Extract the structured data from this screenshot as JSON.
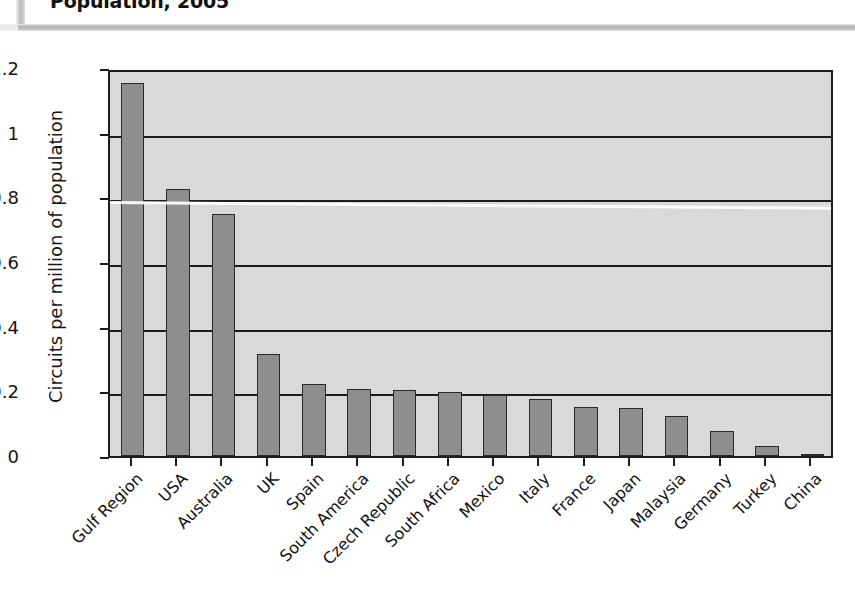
{
  "title": "Population, 2005",
  "chart_data": {
    "type": "bar",
    "title": "Population, 2005",
    "xlabel": "",
    "ylabel": "Circuits per million of population",
    "ylim": [
      0,
      1.2
    ],
    "yticks": [
      "0",
      "0.2",
      "0.4",
      "0.6",
      "0.8",
      "1",
      "1.2"
    ],
    "ytick_values": [
      0,
      0.2,
      0.4,
      0.6,
      0.8,
      1.0,
      1.2
    ],
    "grid": true,
    "legend": "none",
    "categories": [
      "Gulf Region",
      "USA",
      "Australia",
      "UK",
      "Spain",
      "South America",
      "Czech Republic",
      "South Africa",
      "Mexico",
      "Italy",
      "France",
      "Japan",
      "Malaysia",
      "Germany",
      "Turkey",
      "China"
    ],
    "values": [
      1.155,
      0.825,
      0.75,
      0.315,
      0.222,
      0.207,
      0.204,
      0.198,
      0.19,
      0.175,
      0.152,
      0.15,
      0.125,
      0.077,
      0.03,
      0.005
    ]
  },
  "colors": {
    "bar_fill": "#8e8e8e",
    "bar_edge": "#2a2a2a",
    "plot_background": "#d9d9d9",
    "axis": "#1c1c1c",
    "text": "#111111",
    "page_rule": "#b2b2b2"
  }
}
